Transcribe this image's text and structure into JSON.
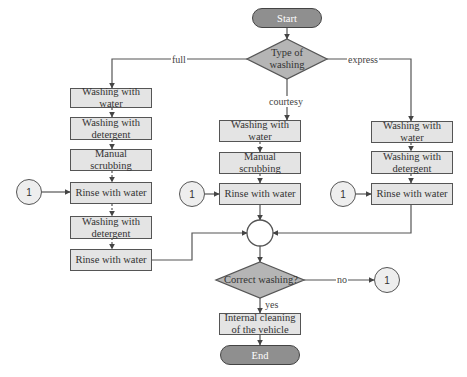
{
  "diagram": {
    "type": "flowchart",
    "start": "Start",
    "end": "End",
    "decision_type": "Type of washing",
    "branches": {
      "full": {
        "label": "full",
        "steps": [
          "Washing with water",
          "Washing with detergent",
          "Manual scrubbing",
          "Rinse with water",
          "Washing with detergent",
          "Rinse with water"
        ]
      },
      "courtesy": {
        "label": "courtesy",
        "steps": [
          "Washing with water",
          "Manual scrubbing",
          "Rinse with water"
        ]
      },
      "express": {
        "label": "express",
        "steps": [
          "Washing with water",
          "Washing with detergent",
          "Rinse with water"
        ]
      }
    },
    "decision_check": "Correct washing?",
    "check_no_label": "no",
    "check_yes_label": "yes",
    "final_step": "Internal cleaning of the vehicle",
    "connector_label": "1",
    "colors": {
      "terminal_fill": "#8f8f8f",
      "decision_fill": "#b5b5b5",
      "process_fill": "#e4e4e4",
      "stroke": "#555555"
    }
  }
}
